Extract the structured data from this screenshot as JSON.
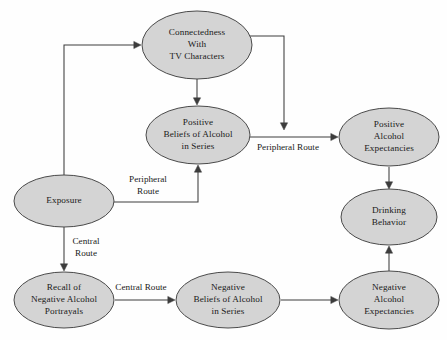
{
  "diagram": {
    "type": "flowchart",
    "colors": {
      "node_fill": "#d4d4d4",
      "node_stroke": "#4a4a4a",
      "edge_stroke": "#3c3c3c",
      "text": "#1a1a1a",
      "background": "#fefefe"
    },
    "nodes": [
      {
        "id": "connectedness",
        "lines": [
          "Connectedness",
          "With",
          "TV Characters"
        ],
        "cx": 197,
        "cy": 45,
        "rx": 55,
        "ry": 34
      },
      {
        "id": "positive_beliefs",
        "lines": [
          "Positive",
          "Beliefs of Alcohol",
          "in Series"
        ],
        "cx": 198,
        "cy": 135,
        "rx": 52,
        "ry": 29
      },
      {
        "id": "positive_expectancies",
        "lines": [
          "Positive",
          "Alcohol",
          "Expectancies"
        ],
        "cx": 389,
        "cy": 137,
        "rx": 50,
        "ry": 29
      },
      {
        "id": "drinking_behavior",
        "lines": [
          "Drinking",
          "Behavior"
        ],
        "cx": 389,
        "cy": 217,
        "rx": 48,
        "ry": 28
      },
      {
        "id": "exposure",
        "lines": [
          "Exposure"
        ],
        "cx": 64,
        "cy": 201,
        "rx": 50,
        "ry": 26
      },
      {
        "id": "recall_negative",
        "lines": [
          "Recall of",
          "Negative Alcohol",
          "Portrayals"
        ],
        "cx": 64,
        "cy": 300,
        "rx": 50,
        "ry": 28
      },
      {
        "id": "negative_beliefs",
        "lines": [
          "Negative",
          "Beliefs of Alcohol",
          "in Series"
        ],
        "cx": 228,
        "cy": 300,
        "rx": 52,
        "ry": 28
      },
      {
        "id": "negative_expectancies",
        "lines": [
          "Negative",
          "Alcohol",
          "Expectancies"
        ],
        "cx": 389,
        "cy": 300,
        "rx": 50,
        "ry": 29
      }
    ],
    "edges": [
      {
        "id": "exposure-to-connectedness",
        "from": "exposure",
        "to": "connectedness",
        "label": "",
        "path": "M 64 175 L 64 45 L 139 45",
        "arrow_at": {
          "x": 141,
          "y": 45,
          "dir": "right"
        }
      },
      {
        "id": "connectedness-to-positive-beliefs",
        "from": "connectedness",
        "to": "positive_beliefs",
        "label": "",
        "path": "M 197 79 L 197 103",
        "arrow_at": {
          "x": 197,
          "y": 105,
          "dir": "down"
        }
      },
      {
        "id": "connectedness-to-peripheral-route",
        "from": "connectedness",
        "to": "positive_expectancies",
        "label": "",
        "path": "M 249 36 L 284 36 L 284 126",
        "arrow_at": {
          "x": 284,
          "y": 130,
          "dir": "down"
        }
      },
      {
        "id": "positive-beliefs-to-positive-expectancies",
        "from": "positive_beliefs",
        "to": "positive_expectancies",
        "label": "Peripheral Route",
        "label_x": 288,
        "label_y": 148,
        "path": "M 250 137 L 336 137",
        "arrow_at": {
          "x": 338,
          "y": 137,
          "dir": "right"
        }
      },
      {
        "id": "exposure-to-positive-beliefs",
        "from": "exposure",
        "to": "positive_beliefs",
        "label": "Peripheral\nRoute",
        "label_x": 148,
        "label_y": 186,
        "path": "M 114 202 L 198 202 L 198 169",
        "arrow_at": {
          "x": 198,
          "y": 165,
          "dir": "up"
        }
      },
      {
        "id": "exposure-to-recall",
        "from": "exposure",
        "to": "recall_negative",
        "label": "Central\nRoute",
        "label_x": 86,
        "label_y": 248,
        "path": "M 64 227 L 64 268",
        "arrow_at": {
          "x": 64,
          "y": 271,
          "dir": "down"
        }
      },
      {
        "id": "recall-to-negative-beliefs",
        "from": "recall_negative",
        "to": "negative_beliefs",
        "label": "Central Route",
        "label_x": 141,
        "label_y": 288,
        "path": "M 115 300 L 173 300",
        "arrow_at": {
          "x": 175,
          "y": 300,
          "dir": "right"
        }
      },
      {
        "id": "negative-beliefs-to-negative-expectancies",
        "from": "negative_beliefs",
        "to": "negative_expectancies",
        "label": "",
        "path": "M 281 300 L 336 300",
        "arrow_at": {
          "x": 338,
          "y": 300,
          "dir": "right"
        }
      },
      {
        "id": "positive-expectancies-to-drinking",
        "from": "positive_expectancies",
        "to": "drinking_behavior",
        "label": "",
        "path": "M 389 167 L 389 186",
        "arrow_at": {
          "x": 389,
          "y": 189,
          "dir": "down"
        }
      },
      {
        "id": "negative-expectancies-to-drinking",
        "from": "negative_expectancies",
        "to": "drinking_behavior",
        "label": "",
        "path": "M 389 272 L 389 249",
        "arrow_at": {
          "x": 389,
          "y": 246,
          "dir": "up"
        }
      }
    ]
  }
}
